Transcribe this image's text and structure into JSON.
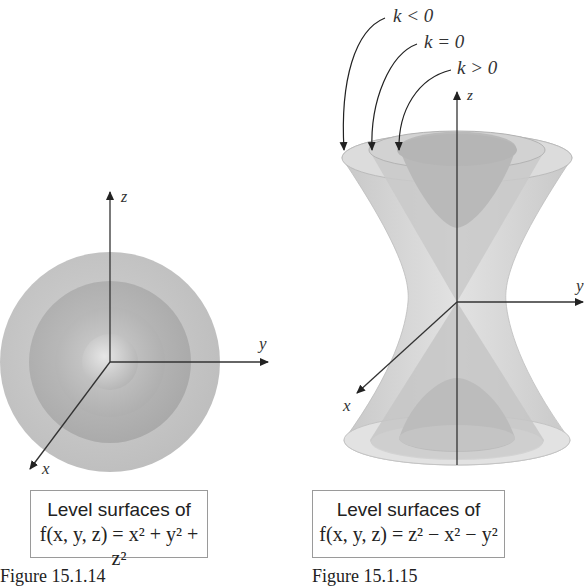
{
  "figures": [
    {
      "id": "left",
      "label": "Figure 15.1.14",
      "caption_title": "Level surfaces of",
      "caption_formula": "f(x, y, z) = x² + y² + z²",
      "axes": {
        "x": "x",
        "y": "y",
        "z": "z"
      },
      "surfaces": "concentric spheres"
    },
    {
      "id": "right",
      "label": "Figure 15.1.15",
      "caption_title": "Level surfaces of",
      "caption_formula": "f(x, y, z) = z² − x² − y²",
      "axes": {
        "x": "x",
        "y": "y",
        "z": "z"
      },
      "annotations": [
        "k < 0",
        "k = 0",
        "k > 0"
      ],
      "surfaces": "hyperboloid of one sheet (k<0), cone (k=0), hyperboloid of two sheets (k>0)"
    }
  ],
  "colors": {
    "surface_light": "#d9d9d9",
    "surface_mid": "#c2c2c2",
    "surface_dark": "#a9a9a9",
    "axis": "#333333",
    "box_border": "#9a9a9a"
  }
}
